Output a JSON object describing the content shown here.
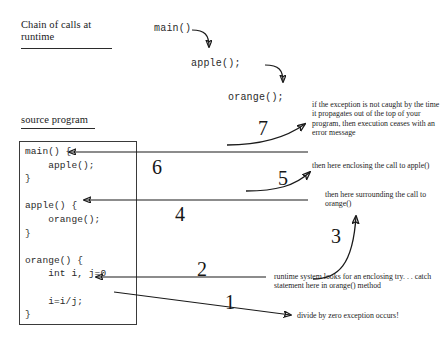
{
  "diagram": {
    "title_chain": "Chain of calls at runtime",
    "title_source": "source program"
  },
  "chain_of_calls": {
    "frames": [
      {
        "label": "main()"
      },
      {
        "label": "apple();"
      },
      {
        "label": "orange();"
      }
    ],
    "arrows": [
      {
        "name": "main-to-apple",
        "from": "main()",
        "to": "apple();"
      },
      {
        "name": "apple-to-orange",
        "from": "apple();",
        "to": "orange();"
      }
    ]
  },
  "source_program": {
    "code": "main() {\n    apple();\n}\n\napple() {\n    orange();\n}\n\norange() {\n    int i, j=0\n\n    i=i/j;\n}"
  },
  "steps": [
    {
      "number": "1",
      "text": "divide by zero exception occurs!",
      "arrow": "from i=i/j; line out to the right, pointing at the note"
    },
    {
      "number": "2",
      "text": "runtime system looks for an enclosing try. . . catch statement here in orange() method",
      "arrow": "horizontal line pointing left into the orange() method body"
    },
    {
      "number": "3",
      "text": "then here surrounding the call to orange()",
      "arrow": "curved arrow sweeping up and to the right"
    },
    {
      "number": "4",
      "text": "",
      "arrow": "horizontal line pointing left into apple() { orange(); }"
    },
    {
      "number": "5",
      "text": "then here enclosing the call to apple()",
      "arrow": "curved arrow sweeping up and to the right"
    },
    {
      "number": "6",
      "text": "",
      "arrow": "horizontal line pointing left into main() { apple(); }"
    },
    {
      "number": "7",
      "text": "if the exception is not caught by the time it propagates out of the top of your program, then execution ceases with an error message",
      "arrow": "curved arrow sweeping up and to the right"
    }
  ],
  "colors": {
    "ink": "#1a1a1a",
    "code_ink": "#2a2a2a",
    "background": "#ffffff"
  }
}
